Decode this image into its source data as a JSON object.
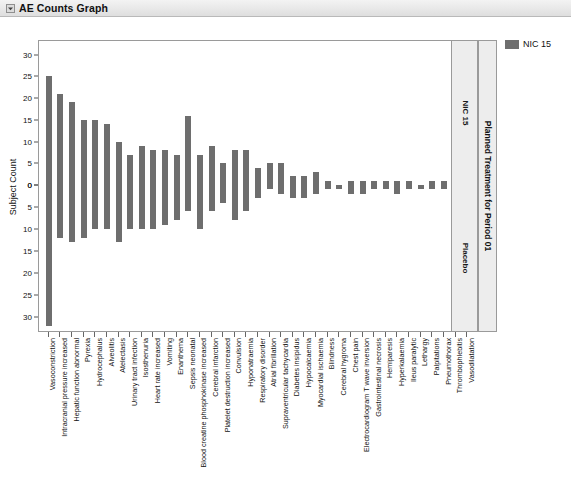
{
  "window": {
    "title": "AE Counts Graph",
    "collapse_icon": "triangle-down-icon"
  },
  "legend": {
    "entries": [
      {
        "label": "Count",
        "color": "#6e6e6e",
        "swatch_icon": "legend-swatch-icon"
      }
    ]
  },
  "panel_strip": {
    "title": "Planned Treatment for Period 01",
    "panels": [
      {
        "label": "NIC 15"
      },
      {
        "label": "Placebo"
      }
    ]
  },
  "chart_data": {
    "type": "bar",
    "title": "AE Counts Graph",
    "xlabel": "",
    "ylabel": "Subject Count",
    "ylim": [
      0,
      32
    ],
    "yticks": [
      0,
      5,
      10,
      15,
      20,
      25,
      30
    ],
    "grid": false,
    "legend_position": "top-right",
    "layout": "two-panel-mirrored",
    "panel_variable": "Planned Treatment for Period 01",
    "categories": [
      "Vasoconstriction",
      "Intracranial pressure increased",
      "Hepatic function abnormal",
      "Pyrexia",
      "Hydrocephalus",
      "Alveolitis",
      "Atelectasis",
      "Urinary tract infection",
      "Isosthenuria",
      "Heart rate increased",
      "Vomiting",
      "Enanthema",
      "Sepsis neonatal",
      "Blood creatine phosphokinase increased",
      "Cerebral infarction",
      "Platelet destruction increased",
      "Convulsion",
      "Hyponatraemia",
      "Respiratory disorder",
      "Atrial fibrillation",
      "Supraventricular tachycardia",
      "Diabetes insipidus",
      "Hypocalcaemia",
      "Myocardial ischaemia",
      "Blindness",
      "Cerebral hygroma",
      "Chest pain",
      "Electrocardiogram T wave inversion",
      "Gastrointestinal necrosis",
      "Hemiparesis",
      "Hyperkalaemia",
      "Ileus paralytic",
      "Lethargy",
      "Palpitations",
      "Pneumothorax",
      "Thrombophlebitis",
      "Vasodilatation"
    ],
    "series": [
      {
        "name": "NIC 15",
        "panel": "NIC 15",
        "direction": "up",
        "color": "#6e6e6e",
        "values": [
          25,
          21,
          19,
          15,
          15,
          14,
          10,
          7,
          9,
          8,
          8,
          7,
          16,
          7,
          9,
          5,
          8,
          8,
          4,
          5,
          5,
          2,
          2,
          3,
          1,
          0,
          1,
          1,
          1,
          1,
          1,
          1,
          0,
          1,
          1,
          1,
          1
        ]
      },
      {
        "name": "Placebo",
        "panel": "Placebo",
        "direction": "down",
        "color": "#6e6e6e",
        "values": [
          32,
          12,
          13,
          12,
          10,
          10,
          13,
          10,
          10,
          10,
          9,
          8,
          6,
          10,
          6,
          4,
          8,
          6,
          3,
          1,
          2,
          3,
          3,
          2,
          1,
          1,
          2,
          2,
          1,
          1,
          2,
          1,
          1,
          1,
          1,
          1,
          1
        ]
      }
    ]
  }
}
